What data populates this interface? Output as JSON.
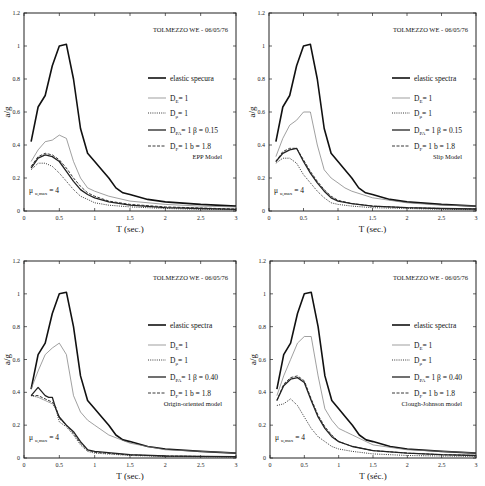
{
  "figure": {
    "x_label": "T (sec.)",
    "y_label": "a/g",
    "x_ticks": [
      "0",
      "0.5",
      "1",
      "1.5",
      "2",
      "2.5",
      "3"
    ],
    "y_ticks": [
      "0",
      "0.2",
      "0.4",
      "0.6",
      "0.8",
      "1",
      "1.2"
    ],
    "record": "TOLMEZZO WE - 06/05/76",
    "ductility_label": "μ u,max = 4"
  },
  "chart_data": [
    {
      "type": "line",
      "title": "EPP Model",
      "record": "TOLMEZZO WE - 06/05/76",
      "xlabel": "T (sec.)",
      "ylabel": "a/g",
      "xlim": [
        0,
        3
      ],
      "ylim": [
        0,
        1.2
      ],
      "grid": false,
      "legend_position": "right-middle",
      "annotation": "μ u,max = 4",
      "box": {
        "x0": 24,
        "x1": 236,
        "y0": 211,
        "y1": 13
      },
      "legend": {
        "x": 148,
        "y": 78
      },
      "series": [
        {
          "name": "elastic specura",
          "style": "solid-thick",
          "x": [
            0.1,
            0.2,
            0.3,
            0.4,
            0.5,
            0.6,
            0.7,
            0.8,
            0.9,
            1.0,
            1.1,
            1.2,
            1.3,
            1.4,
            1.5,
            1.75,
            2.0,
            2.5,
            3.0
          ],
          "y": [
            0.42,
            0.63,
            0.7,
            0.88,
            1.0,
            1.01,
            0.8,
            0.5,
            0.35,
            0.3,
            0.25,
            0.2,
            0.14,
            0.11,
            0.1,
            0.07,
            0.055,
            0.04,
            0.03
          ]
        },
        {
          "name": "D_E = 1",
          "style": "solid-thin",
          "x": [
            0.1,
            0.2,
            0.3,
            0.4,
            0.5,
            0.6,
            0.7,
            0.8,
            0.9,
            1.0,
            1.2,
            1.5,
            2.0,
            2.5,
            3.0
          ],
          "y": [
            0.3,
            0.37,
            0.42,
            0.43,
            0.46,
            0.44,
            0.3,
            0.2,
            0.14,
            0.12,
            0.09,
            0.06,
            0.04,
            0.03,
            0.025
          ]
        },
        {
          "name": "D_μ = 1",
          "style": "dotted",
          "x": [
            0.1,
            0.2,
            0.3,
            0.4,
            0.5,
            0.6,
            0.7,
            0.8,
            0.9,
            1.0,
            1.2,
            1.5,
            2.0,
            2.5,
            3.0
          ],
          "y": [
            0.25,
            0.29,
            0.29,
            0.27,
            0.23,
            0.18,
            0.13,
            0.09,
            0.07,
            0.05,
            0.035,
            0.025,
            0.015,
            0.01,
            0.008
          ]
        },
        {
          "name": "D_PA = 1  β = 0.15",
          "style": "solid-medium",
          "x": [
            0.1,
            0.2,
            0.3,
            0.4,
            0.5,
            0.6,
            0.7,
            0.8,
            0.9,
            1.0,
            1.2,
            1.5,
            2.0,
            2.5,
            3.0
          ],
          "y": [
            0.26,
            0.32,
            0.34,
            0.33,
            0.3,
            0.24,
            0.18,
            0.13,
            0.1,
            0.08,
            0.055,
            0.035,
            0.02,
            0.015,
            0.01
          ]
        },
        {
          "name": "D_F = 1  b = 1.8",
          "style": "dashed",
          "x": [
            0.1,
            0.2,
            0.3,
            0.4,
            0.5,
            0.6,
            0.7,
            0.8,
            0.9,
            1.0,
            1.2,
            1.5,
            2.0,
            2.5,
            3.0
          ],
          "y": [
            0.27,
            0.33,
            0.35,
            0.34,
            0.31,
            0.26,
            0.2,
            0.15,
            0.11,
            0.09,
            0.06,
            0.04,
            0.025,
            0.018,
            0.012
          ]
        }
      ]
    },
    {
      "type": "line",
      "title": "Slip Model",
      "record": "TOLMEZZO WE - 06/05/76",
      "xlabel": "T (sec.)",
      "ylabel": "a/g",
      "xlim": [
        0,
        3
      ],
      "ylim": [
        0,
        1.2
      ],
      "grid": false,
      "legend_position": "right-middle",
      "annotation": "μ u,max = 4",
      "box": {
        "x0": 269,
        "x1": 476,
        "y0": 211,
        "y1": 13
      },
      "legend": {
        "x": 392,
        "y": 78
      },
      "series": [
        {
          "name": "elastic spectra",
          "style": "solid-thick",
          "x": [
            0.1,
            0.2,
            0.3,
            0.4,
            0.5,
            0.6,
            0.7,
            0.8,
            0.9,
            1.0,
            1.1,
            1.2,
            1.3,
            1.4,
            1.5,
            1.75,
            2.0,
            2.5,
            3.0
          ],
          "y": [
            0.42,
            0.63,
            0.7,
            0.88,
            1.0,
            1.01,
            0.8,
            0.5,
            0.35,
            0.3,
            0.25,
            0.2,
            0.14,
            0.11,
            0.1,
            0.07,
            0.055,
            0.04,
            0.03
          ]
        },
        {
          "name": "D_E = 1",
          "style": "solid-thin",
          "x": [
            0.1,
            0.2,
            0.3,
            0.4,
            0.5,
            0.6,
            0.7,
            0.8,
            0.9,
            1.0,
            1.1,
            1.2,
            1.5,
            2.0,
            2.5,
            3.0
          ],
          "y": [
            0.33,
            0.44,
            0.52,
            0.55,
            0.6,
            0.6,
            0.4,
            0.25,
            0.2,
            0.17,
            0.14,
            0.12,
            0.08,
            0.05,
            0.035,
            0.03
          ]
        },
        {
          "name": "D_μ = 1",
          "style": "dotted",
          "x": [
            0.1,
            0.2,
            0.3,
            0.4,
            0.5,
            0.6,
            0.7,
            0.8,
            0.9,
            1.0,
            1.2,
            1.5,
            2.0,
            2.5,
            3.0
          ],
          "y": [
            0.29,
            0.32,
            0.32,
            0.29,
            0.22,
            0.17,
            0.12,
            0.08,
            0.05,
            0.04,
            0.03,
            0.02,
            0.015,
            0.01,
            0.008
          ]
        },
        {
          "name": "D_PA = 1  β = 0.15",
          "style": "solid-medium",
          "x": [
            0.1,
            0.2,
            0.3,
            0.4,
            0.5,
            0.6,
            0.7,
            0.8,
            0.9,
            1.0,
            1.2,
            1.5,
            2.0,
            2.5,
            3.0
          ],
          "y": [
            0.3,
            0.35,
            0.37,
            0.38,
            0.3,
            0.23,
            0.17,
            0.12,
            0.08,
            0.06,
            0.045,
            0.03,
            0.02,
            0.015,
            0.012
          ]
        },
        {
          "name": "D_F = 1  b = 1.8",
          "style": "dashed",
          "x": [
            0.1,
            0.2,
            0.3,
            0.4,
            0.5,
            0.6,
            0.7,
            0.8,
            0.9,
            1.0,
            1.2,
            1.5,
            2.0,
            2.5,
            3.0
          ],
          "y": [
            0.3,
            0.36,
            0.38,
            0.38,
            0.31,
            0.24,
            0.18,
            0.13,
            0.09,
            0.065,
            0.045,
            0.03,
            0.02,
            0.015,
            0.012
          ]
        }
      ]
    },
    {
      "type": "line",
      "title": "Origin-oriented model",
      "record": "TOLMEZZO WE - 06/05/76",
      "xlabel": "T (sec.)",
      "ylabel": "a/g",
      "xlim": [
        0,
        3
      ],
      "ylim": [
        0,
        1.2
      ],
      "grid": false,
      "legend_position": "right-middle",
      "annotation": "μ u,max = 4",
      "box": {
        "x0": 24,
        "x1": 236,
        "y0": 458,
        "y1": 261
      },
      "legend": {
        "x": 148,
        "y": 325
      },
      "series": [
        {
          "name": "elastic spectra",
          "style": "solid-thick",
          "x": [
            0.1,
            0.2,
            0.3,
            0.4,
            0.5,
            0.6,
            0.7,
            0.8,
            0.9,
            1.0,
            1.1,
            1.2,
            1.3,
            1.4,
            1.5,
            1.75,
            2.0,
            2.5,
            3.0
          ],
          "y": [
            0.42,
            0.63,
            0.7,
            0.88,
            1.0,
            1.01,
            0.8,
            0.5,
            0.35,
            0.3,
            0.25,
            0.2,
            0.14,
            0.11,
            0.1,
            0.07,
            0.055,
            0.04,
            0.03
          ]
        },
        {
          "name": "D_E = 1",
          "style": "solid-thin",
          "x": [
            0.1,
            0.2,
            0.3,
            0.4,
            0.5,
            0.6,
            0.7,
            0.8,
            0.9,
            1.0,
            1.2,
            1.5,
            2.0,
            2.5,
            3.0
          ],
          "y": [
            0.42,
            0.53,
            0.63,
            0.67,
            0.7,
            0.63,
            0.38,
            0.28,
            0.23,
            0.2,
            0.14,
            0.09,
            0.05,
            0.04,
            0.03
          ]
        },
        {
          "name": "D_μ = 1",
          "style": "dotted",
          "x": [
            0.1,
            0.2,
            0.3,
            0.4,
            0.45,
            0.5,
            0.6,
            0.7,
            0.8,
            0.9,
            1.0,
            1.5,
            2.0,
            2.5,
            3.0
          ],
          "y": [
            0.38,
            0.37,
            0.35,
            0.33,
            0.3,
            0.22,
            0.19,
            0.14,
            0.08,
            0.04,
            0.03,
            0.015,
            0.01,
            0.008,
            0.006
          ]
        },
        {
          "name": "D_PA = 1  β = 0.40",
          "style": "solid-medium",
          "x": [
            0.1,
            0.2,
            0.3,
            0.35,
            0.4,
            0.45,
            0.5,
            0.6,
            0.7,
            0.8,
            0.9,
            1.0,
            1.5,
            2.0,
            2.5,
            3.0
          ],
          "y": [
            0.38,
            0.43,
            0.38,
            0.37,
            0.37,
            0.3,
            0.25,
            0.2,
            0.16,
            0.1,
            0.05,
            0.04,
            0.02,
            0.012,
            0.01,
            0.008
          ]
        },
        {
          "name": "D_F = 1  b = 1.8",
          "style": "dashed",
          "x": [
            0.1,
            0.2,
            0.3,
            0.4,
            0.45,
            0.5,
            0.6,
            0.7,
            0.8,
            0.9,
            1.0,
            1.5,
            2.0,
            2.5,
            3.0
          ],
          "y": [
            0.38,
            0.38,
            0.36,
            0.34,
            0.31,
            0.24,
            0.2,
            0.15,
            0.09,
            0.05,
            0.035,
            0.018,
            0.012,
            0.01,
            0.008
          ]
        }
      ]
    },
    {
      "type": "line",
      "title": "Clough-Johnson model",
      "record": "TOLMEZZO WE - 06/05/76",
      "xlabel": "T (séc.)",
      "ylabel": "a/g",
      "xlim": [
        0,
        3
      ],
      "ylim": [
        0,
        1.2
      ],
      "grid": false,
      "legend_position": "right-middle",
      "annotation": "μ u,max = 4",
      "box": {
        "x0": 270,
        "x1": 476,
        "y0": 458,
        "y1": 261
      },
      "legend": {
        "x": 392,
        "y": 325
      },
      "series": [
        {
          "name": "elastic spectra",
          "style": "solid-thick",
          "x": [
            0.1,
            0.2,
            0.3,
            0.4,
            0.5,
            0.6,
            0.7,
            0.8,
            0.9,
            1.0,
            1.1,
            1.2,
            1.3,
            1.4,
            1.5,
            1.75,
            2.0,
            2.5,
            3.0
          ],
          "y": [
            0.42,
            0.63,
            0.7,
            0.88,
            1.0,
            1.01,
            0.8,
            0.5,
            0.35,
            0.3,
            0.25,
            0.2,
            0.14,
            0.11,
            0.1,
            0.07,
            0.055,
            0.04,
            0.03
          ]
        },
        {
          "name": "D_E = 1",
          "style": "solid-thin",
          "x": [
            0.1,
            0.2,
            0.3,
            0.4,
            0.5,
            0.6,
            0.7,
            0.8,
            0.9,
            1.0,
            1.1,
            1.2,
            1.5,
            2.0,
            2.5,
            3.0
          ],
          "y": [
            0.38,
            0.5,
            0.6,
            0.7,
            0.74,
            0.74,
            0.5,
            0.3,
            0.23,
            0.18,
            0.16,
            0.14,
            0.08,
            0.05,
            0.04,
            0.03
          ]
        },
        {
          "name": "D_μ = 1",
          "style": "dotted",
          "x": [
            0.1,
            0.2,
            0.3,
            0.4,
            0.5,
            0.6,
            0.7,
            0.8,
            0.9,
            1.0,
            1.2,
            1.5,
            2.0,
            2.5,
            3.0
          ],
          "y": [
            0.32,
            0.33,
            0.36,
            0.32,
            0.25,
            0.18,
            0.13,
            0.1,
            0.07,
            0.055,
            0.04,
            0.025,
            0.015,
            0.012,
            0.01
          ]
        },
        {
          "name": "D_PA = 1  β = 0.40",
          "style": "solid-medium",
          "x": [
            0.1,
            0.2,
            0.3,
            0.4,
            0.5,
            0.6,
            0.7,
            0.8,
            0.9,
            1.0,
            1.2,
            1.5,
            2.0,
            2.5,
            3.0
          ],
          "y": [
            0.35,
            0.44,
            0.48,
            0.49,
            0.46,
            0.35,
            0.25,
            0.18,
            0.13,
            0.1,
            0.07,
            0.045,
            0.03,
            0.02,
            0.015
          ]
        },
        {
          "name": "D_F = 1  b = 1.8",
          "style": "dashed",
          "x": [
            0.1,
            0.2,
            0.3,
            0.4,
            0.5,
            0.6,
            0.7,
            0.8,
            0.9,
            1.0,
            1.2,
            1.5,
            2.0,
            2.5,
            3.0
          ],
          "y": [
            0.35,
            0.45,
            0.49,
            0.5,
            0.47,
            0.36,
            0.26,
            0.19,
            0.14,
            0.1,
            0.07,
            0.045,
            0.03,
            0.02,
            0.015
          ]
        }
      ]
    }
  ]
}
